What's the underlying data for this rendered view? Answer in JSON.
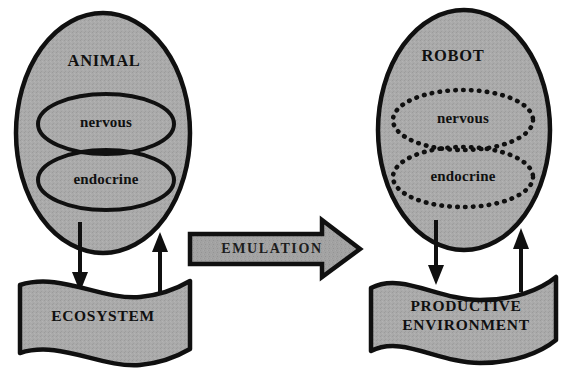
{
  "diagram": {
    "colors": {
      "background": "#ffffff",
      "body_fill": "#a9a9a9",
      "banner_fill": "#a9a9a9",
      "arrow_fill": "#9f9f9f",
      "stroke": "#101010",
      "text": "#101010"
    },
    "left": {
      "organism_label": "ANIMAL",
      "subsystems": [
        {
          "label": "nervous",
          "outline": "solid"
        },
        {
          "label": "endocrine",
          "outline": "solid"
        }
      ],
      "banner_label": "ECOSYSTEM",
      "banner_label_lines": [
        "ECOSYSTEM"
      ],
      "arrow_down_name": "effect-on-environment",
      "arrow_up_name": "feedback-from-environment"
    },
    "right": {
      "organism_label": "ROBOT",
      "subsystems": [
        {
          "label": "nervous",
          "outline": "dotted"
        },
        {
          "label": "endocrine",
          "outline": "dotted"
        }
      ],
      "banner_label": "PRODUCTIVE ENVIRONMENT",
      "banner_label_lines": [
        "PRODUCTIVE",
        "ENVIRONMENT"
      ],
      "arrow_down_name": "effect-on-environment",
      "arrow_up_name": "feedback-from-environment"
    },
    "center_arrow": {
      "label": "EMULATION",
      "direction": "left-to-right"
    }
  }
}
